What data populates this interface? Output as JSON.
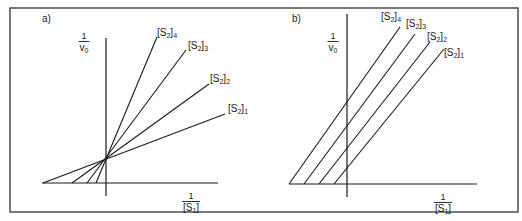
{
  "figure": {
    "frame": {
      "x": 10,
      "y": 8,
      "width": 508,
      "height": 204,
      "stroke": "#333333"
    },
    "line_color": "#1a1a1a",
    "panels": [
      {
        "id": "a",
        "label": "a)",
        "label_pos": [
          42,
          22
        ],
        "y_axis": {
          "x": 106,
          "y1": 38,
          "y2": 196,
          "label_num": "1",
          "label_den": "v",
          "label_den_sub": "0",
          "label_pos": [
            84,
            32
          ]
        },
        "x_axis": {
          "y": 183,
          "x1": 42,
          "x2": 218,
          "label_num": "1",
          "label_den": "[S",
          "label_den_sub": "1",
          "label_den_close": "]",
          "label_pos": [
            191,
            192
          ]
        },
        "lines": [
          {
            "name": "[S2]4",
            "x1": 96,
            "y1": 183,
            "x2": 157,
            "y2": 37,
            "label": "[S",
            "sub": "2",
            "close": "]",
            "idx": "4",
            "label_pos": [
              157,
              36
            ]
          },
          {
            "name": "[S2]3",
            "x1": 87,
            "y1": 183,
            "x2": 186,
            "y2": 50,
            "label": "[S",
            "sub": "2",
            "close": "]",
            "idx": "3",
            "label_pos": [
              188,
              49
            ]
          },
          {
            "name": "[S2]2",
            "x1": 72,
            "y1": 183,
            "x2": 209,
            "y2": 84,
            "label": "[S",
            "sub": "2",
            "close": "]",
            "idx": "2",
            "label_pos": [
              210,
              82
            ]
          },
          {
            "name": "[S2]1",
            "x1": 43,
            "y1": 183,
            "x2": 225,
            "y2": 114,
            "label": "[S",
            "sub": "2",
            "close": "]",
            "idx": "1",
            "label_pos": [
              228,
              112
            ]
          }
        ]
      },
      {
        "id": "b",
        "label": "b)",
        "label_pos": [
          292,
          22
        ],
        "y_axis": {
          "x": 347,
          "y1": 14,
          "y2": 197,
          "label_num": "1",
          "label_den": "v",
          "label_den_sub": "0",
          "label_pos": [
            333,
            32
          ]
        },
        "x_axis": {
          "y": 184,
          "x1": 289,
          "x2": 477,
          "label_num": "1",
          "label_den": "[S",
          "label_den_sub": "1",
          "label_den_close": "]",
          "label_pos": [
            443,
            193
          ]
        },
        "lines": [
          {
            "name": "[S2]4",
            "x1": 289,
            "y1": 184,
            "x2": 400,
            "y2": 27,
            "label": "[S",
            "sub": "2",
            "close": "]",
            "idx": "4",
            "label_pos": [
              381,
              20
            ]
          },
          {
            "name": "[S2]3",
            "x1": 304,
            "y1": 184,
            "x2": 415,
            "y2": 34,
            "label": "[S",
            "sub": "2",
            "close": "]",
            "idx": "3",
            "label_pos": [
              406,
              27
            ]
          },
          {
            "name": "[S2]2",
            "x1": 319,
            "y1": 184,
            "x2": 430,
            "y2": 42,
            "label": "[S",
            "sub": "2",
            "close": "]",
            "idx": "2",
            "label_pos": [
              427,
              40
            ]
          },
          {
            "name": "[S2]1",
            "x1": 334,
            "y1": 184,
            "x2": 444,
            "y2": 49,
            "label": "[S",
            "sub": "2",
            "close": "]",
            "idx": "1",
            "label_pos": [
              444,
              56
            ]
          }
        ]
      }
    ]
  }
}
